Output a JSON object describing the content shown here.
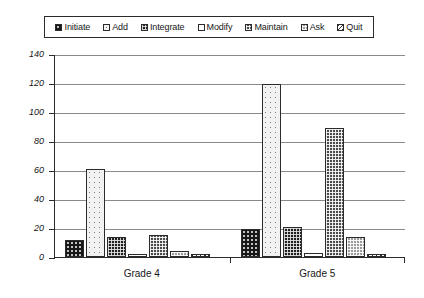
{
  "chart_data": {
    "type": "bar",
    "title": "",
    "subtitle": "",
    "xlabel": "",
    "ylabel": "",
    "categories": [
      "Grade 4",
      "Grade 5"
    ],
    "ylim": [
      0,
      140
    ],
    "ytick_labels": [
      "0",
      "20",
      "40",
      "60",
      "80",
      "100",
      "120",
      "140"
    ],
    "ytick_values": [
      0,
      20,
      40,
      60,
      80,
      100,
      120,
      140
    ],
    "grid": true,
    "legend_position": "top",
    "series": [
      {
        "name": "Initiate",
        "pattern": "dark-dotted",
        "values": [
          12,
          19
        ]
      },
      {
        "name": "Add",
        "pattern": "light-dotted",
        "values": [
          61,
          119
        ]
      },
      {
        "name": "Integrate",
        "pattern": "dark-checker",
        "values": [
          14,
          21
        ]
      },
      {
        "name": "Modify",
        "pattern": "white-blank",
        "values": [
          2,
          3
        ]
      },
      {
        "name": "Maintain",
        "pattern": "medium-checker",
        "values": [
          15,
          89
        ]
      },
      {
        "name": "Ask",
        "pattern": "gray-checker",
        "values": [
          4,
          14
        ]
      },
      {
        "name": "Quit",
        "pattern": "light-hatch",
        "values": [
          2,
          2
        ]
      }
    ],
    "colors": {
      "axis": "#2b2b2b",
      "gridline": "#8a8a8a",
      "text": "#171717",
      "background": "#ffffff"
    }
  }
}
